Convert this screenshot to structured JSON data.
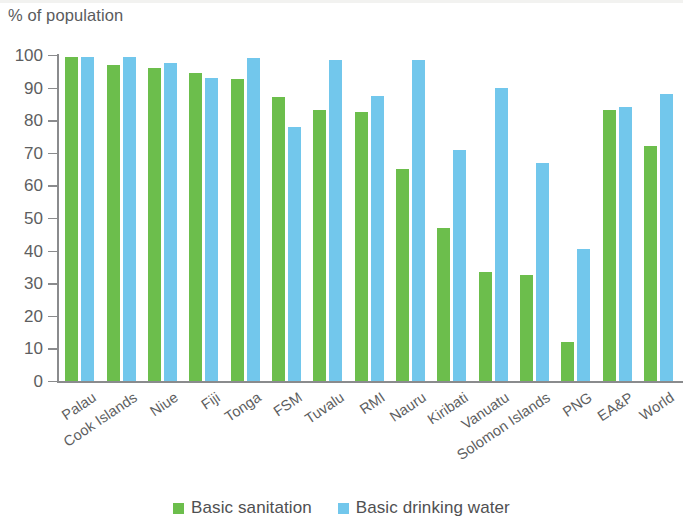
{
  "chart_data": {
    "type": "bar",
    "title": "",
    "xlabel": "",
    "ylabel": "% of population",
    "ylim": [
      0,
      100
    ],
    "yticks": [
      0,
      10,
      20,
      30,
      40,
      50,
      60,
      70,
      80,
      90,
      100
    ],
    "grid": false,
    "legend_position": "bottom-center",
    "categories": [
      "Palau",
      "Cook Islands",
      "Niue",
      "Fiji",
      "Tonga",
      "FSM",
      "Tuvalu",
      "RMI",
      "Nauru",
      "Kiribati",
      "Vanuatu",
      "Solomon Islands",
      "PNG",
      "EA&P",
      "World"
    ],
    "series": [
      {
        "name": "Basic sanitation",
        "color": "#6cbe4c",
        "values": [
          99.5,
          97,
          96,
          94.5,
          92.5,
          87,
          83,
          82.5,
          65,
          47,
          33.5,
          32.5,
          12,
          83,
          72
        ]
      },
      {
        "name": "Basic drinking water",
        "color": "#72c7ec",
        "values": [
          99.5,
          99.5,
          97.5,
          93,
          99,
          78,
          98.5,
          87.5,
          98.5,
          71,
          90,
          67,
          40.5,
          84,
          88
        ]
      }
    ]
  },
  "axis": {
    "y_title": "% of population"
  },
  "legend": {
    "items": [
      {
        "label": "Basic sanitation",
        "color": "#6cbe4c"
      },
      {
        "label": "Basic drinking water",
        "color": "#72c7ec"
      }
    ]
  }
}
